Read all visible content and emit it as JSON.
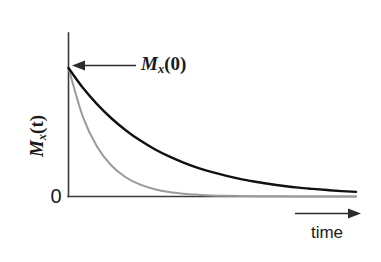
{
  "figure": {
    "kind": "line-plot",
    "background_color": "#ffffff",
    "caption_text": ""
  },
  "labels": {
    "y_axis": {
      "full_text": "Mx(t)",
      "variable": "M",
      "subscript": "x",
      "argument": "(t)",
      "rotation_deg": -90
    },
    "x_axis": {
      "full_text": "time"
    },
    "origin_tick": {
      "full_text": "0"
    },
    "annotation": {
      "full_text": "Mx(0)",
      "variable": "M",
      "subscript": "x",
      "argument": "(0)",
      "arrow_direction": "left",
      "points_to": "curve-start-value"
    }
  },
  "colors": {
    "axis": "#3a3a3a",
    "curve_slow": "#111111",
    "curve_fast": "#9a9a9a",
    "arrow": "#2b2b2b",
    "text": "#1a1a1a"
  },
  "chart_data": {
    "type": "line",
    "title": "",
    "xlabel": "time",
    "ylabel": "Mx(t)",
    "grid": false,
    "legend": "none",
    "annotations": [
      {
        "text": "Mx(0)",
        "target_x": 0,
        "target_y": 1.0,
        "arrow_direction": "left"
      }
    ],
    "xlim": [
      0,
      10
    ],
    "ylim": [
      0,
      1.12
    ],
    "xticks": [],
    "yticks": [
      0
    ],
    "ytick_labels": [
      "0"
    ],
    "series": [
      {
        "name": "slow transverse decay",
        "color": "#111111",
        "width_px": 2.4,
        "model": "exp(-t/T2_long)",
        "T2": 3.0,
        "x": [
          0,
          0.5,
          1,
          1.5,
          2,
          2.5,
          3,
          3.5,
          4,
          4.5,
          5,
          5.5,
          6,
          6.5,
          7,
          7.5,
          8,
          8.5,
          9,
          9.5,
          10
        ],
        "y": [
          1.0,
          0.846,
          0.717,
          0.607,
          0.514,
          0.435,
          0.368,
          0.312,
          0.264,
          0.223,
          0.189,
          0.16,
          0.135,
          0.115,
          0.097,
          0.082,
          0.069,
          0.059,
          0.05,
          0.042,
          0.036
        ]
      },
      {
        "name": "fast transverse decay",
        "color": "#9a9a9a",
        "width_px": 2.0,
        "model": "exp(-t/T2_short)",
        "T2": 1.05,
        "x": [
          0,
          0.5,
          1,
          1.5,
          2,
          2.5,
          3,
          3.5,
          4,
          4.5,
          5,
          5.5,
          6,
          6.5,
          7,
          7.5,
          8,
          8.5,
          9,
          9.5,
          10
        ],
        "y": [
          1.0,
          0.62,
          0.385,
          0.239,
          0.148,
          0.092,
          0.057,
          0.035,
          0.022,
          0.014,
          0.008,
          0.005,
          0.003,
          0.002,
          0.001,
          0.001,
          0.0,
          0.0,
          0.0,
          0.0,
          0.0
        ]
      }
    ]
  }
}
